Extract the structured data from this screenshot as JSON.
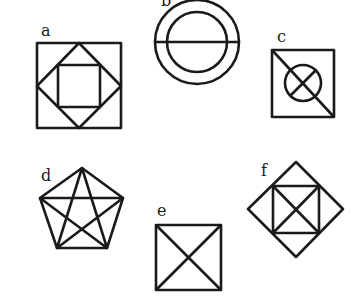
{
  "figures": [
    {
      "label": "a",
      "description": "square with inscribed diamond and inner square"
    },
    {
      "label": "b",
      "description": "two concentric circles with horizontal diameter"
    },
    {
      "label": "c",
      "description": "square with diagonal and circle with cross"
    },
    {
      "label": "d",
      "description": "pentagon with inscribed pentagram"
    },
    {
      "label": "e",
      "description": "square with both diagonals"
    },
    {
      "label": "f",
      "description": "diamond with inscribed square and diagonals"
    }
  ],
  "colors": {
    "stroke": "#1a1a1a",
    "background": "#ffffff"
  }
}
